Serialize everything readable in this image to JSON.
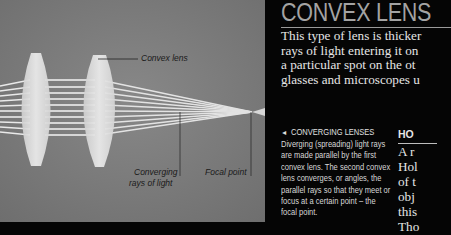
{
  "photo": {
    "labels": {
      "convex_lens": "Convex lens",
      "converging_line1": "Converging",
      "converging_line2": "rays of light",
      "focal_point": "Focal point"
    },
    "colors": {
      "background": "#7f7f7f",
      "lens": "#e8e8e8",
      "rays": "#f2f2f2"
    }
  },
  "article": {
    "title": "CONVEX LENS",
    "intro_lines": [
      "This type of lens is thicker",
      "rays of light entering it on",
      "a particular spot on the ot",
      "glasses and microscopes u"
    ],
    "caption": {
      "arrow_icon": "◄",
      "heading": "CONVERGING LENSES",
      "lines": [
        "Diverging (spreading) light rays",
        "are made parallel by the first",
        "convex lens. The second convex",
        "lens converges, or angles, the",
        "parallel rays so that they meet or",
        "focus at a certain point – the",
        "focal point."
      ]
    },
    "sidebar": {
      "heading": "HO",
      "lines": [
        "A r",
        "Hol",
        "of t",
        "obj",
        "this",
        "Tho"
      ]
    }
  }
}
